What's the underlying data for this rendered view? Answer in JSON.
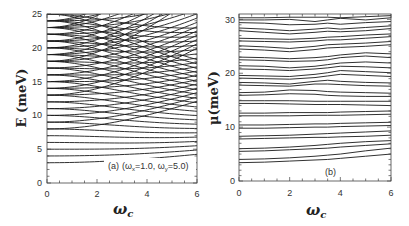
{
  "chart_data": [
    {
      "panel": "a",
      "type": "line",
      "title": "",
      "xlabel": "ω_c",
      "ylabel": "E (meV)",
      "xlim": [
        0,
        6
      ],
      "ylim": [
        0,
        25
      ],
      "xticks": [
        0,
        2,
        4,
        6
      ],
      "yticks": [
        0,
        5,
        10,
        15,
        20,
        25
      ],
      "annotation": "(a) (ω_x=1.0, ω_y=5.0)",
      "grid": false,
      "model": {
        "omega_x": 1.0,
        "omega_y": 5.0,
        "emax": 25.6
      },
      "description": "Energy levels E=(n+1/2)ω+ + (m+1/2)ω− of an anisotropic 2D oscillator vs cyclotron frequency; at ω_c=0 levels at 3,4,5,6,7,8,8,9,9,...",
      "series_start_values": [
        3,
        4,
        5,
        6,
        7,
        8,
        8,
        9,
        9,
        10,
        10,
        11,
        11,
        12,
        12,
        13,
        13,
        13,
        14,
        14,
        14,
        15,
        15,
        15,
        16,
        16,
        16,
        17,
        17,
        17,
        18,
        18,
        18,
        18,
        19,
        19,
        19,
        19,
        20,
        20,
        20,
        20,
        21,
        21,
        21,
        21,
        22,
        22,
        22,
        22
      ]
    },
    {
      "panel": "b",
      "type": "line",
      "title": "",
      "xlabel": "ω_c",
      "ylabel": "μ(meV)",
      "xlim": [
        0,
        6
      ],
      "ylim": [
        0,
        31
      ],
      "xticks": [
        0,
        2,
        4,
        6
      ],
      "yticks": [
        0,
        10,
        20,
        30
      ],
      "annotation": "(b)",
      "grid": false,
      "x": [
        0,
        1,
        2,
        3,
        3.5,
        4,
        5,
        6
      ],
      "series": [
        {
          "name": "μ1",
          "values": [
            3.4,
            3.5,
            3.7,
            3.9,
            4.0,
            4.2,
            4.6,
            5.0
          ]
        },
        {
          "name": "μ2",
          "values": [
            4.0,
            4.1,
            4.3,
            4.6,
            4.8,
            5.0,
            5.6,
            6.1
          ]
        },
        {
          "name": "μ3",
          "values": [
            5.5,
            5.6,
            5.8,
            6.0,
            6.1,
            6.3,
            6.6,
            6.9
          ]
        },
        {
          "name": "μ4",
          "values": [
            6.0,
            6.1,
            6.3,
            6.6,
            6.8,
            7.0,
            7.3,
            7.5
          ]
        },
        {
          "name": "μ5",
          "values": [
            7.8,
            7.9,
            8.0,
            8.1,
            8.1,
            8.2,
            8.3,
            8.5
          ]
        },
        {
          "name": "μ6",
          "values": [
            8.3,
            8.4,
            8.5,
            8.7,
            8.8,
            8.9,
            9.1,
            9.3
          ]
        },
        {
          "name": "μ7",
          "values": [
            9.8,
            9.8,
            9.9,
            10.0,
            10.0,
            10.1,
            10.2,
            10.3
          ]
        },
        {
          "name": "μ8",
          "values": [
            10.4,
            10.4,
            10.5,
            10.6,
            10.6,
            10.7,
            10.8,
            10.9
          ]
        },
        {
          "name": "μ9",
          "values": [
            12.1,
            12.1,
            12.1,
            12.2,
            12.2,
            12.2,
            12.3,
            12.4
          ]
        },
        {
          "name": "μ10",
          "values": [
            12.6,
            12.6,
            12.7,
            12.7,
            12.7,
            12.8,
            12.9,
            13.0
          ]
        },
        {
          "name": "μ11",
          "values": [
            14.4,
            14.4,
            14.3,
            14.2,
            14.2,
            14.2,
            14.1,
            14.0
          ]
        },
        {
          "name": "μ12",
          "values": [
            14.9,
            14.9,
            14.9,
            14.8,
            14.8,
            14.8,
            14.8,
            14.8
          ]
        },
        {
          "name": "μ13",
          "values": [
            15.9,
            16.0,
            16.2,
            16.1,
            15.9,
            15.8,
            15.7,
            15.7
          ]
        },
        {
          "name": "μ14",
          "values": [
            16.4,
            16.5,
            16.9,
            16.8,
            16.6,
            16.5,
            16.4,
            16.3
          ]
        },
        {
          "name": "μ15",
          "values": [
            17.8,
            17.7,
            17.6,
            18.0,
            18.0,
            17.9,
            17.7,
            17.6
          ]
        },
        {
          "name": "μ16",
          "values": [
            18.3,
            18.2,
            18.0,
            18.5,
            18.7,
            18.5,
            18.3,
            18.2
          ]
        },
        {
          "name": "μ17",
          "values": [
            19.1,
            19.0,
            18.9,
            19.2,
            19.5,
            19.8,
            19.6,
            19.4
          ]
        },
        {
          "name": "μ18",
          "values": [
            19.6,
            19.5,
            19.4,
            19.8,
            20.1,
            20.5,
            20.3,
            20.1
          ]
        },
        {
          "name": "μ19",
          "values": [
            20.8,
            20.7,
            20.5,
            20.8,
            21.0,
            21.3,
            21.2,
            21.0
          ]
        },
        {
          "name": "μ20",
          "values": [
            21.4,
            21.3,
            21.0,
            21.3,
            21.6,
            21.9,
            22.1,
            21.9
          ]
        },
        {
          "name": "μ21",
          "values": [
            22.5,
            22.4,
            22.2,
            22.3,
            22.5,
            22.9,
            23.2,
            22.9
          ]
        },
        {
          "name": "μ22",
          "values": [
            23.0,
            22.9,
            22.7,
            22.9,
            23.1,
            23.4,
            23.8,
            23.6
          ]
        },
        {
          "name": "μ23",
          "values": [
            24.5,
            24.3,
            24.0,
            24.4,
            24.7,
            24.8,
            25.0,
            25.3
          ]
        },
        {
          "name": "μ24",
          "values": [
            25.1,
            24.9,
            24.6,
            25.0,
            25.3,
            25.4,
            25.6,
            25.9
          ]
        },
        {
          "name": "μ25",
          "values": [
            26.0,
            25.9,
            25.8,
            26.0,
            26.2,
            26.2,
            26.5,
            26.8
          ]
        },
        {
          "name": "μ26",
          "values": [
            26.5,
            26.4,
            26.3,
            26.5,
            26.7,
            26.8,
            27.1,
            27.3
          ]
        },
        {
          "name": "μ27",
          "values": [
            27.9,
            27.6,
            27.3,
            27.6,
            27.8,
            27.7,
            27.9,
            28.3
          ]
        },
        {
          "name": "μ28",
          "values": [
            28.4,
            28.2,
            27.9,
            28.2,
            28.4,
            28.2,
            28.5,
            28.8
          ]
        },
        {
          "name": "μ29",
          "values": [
            29.4,
            29.3,
            29.0,
            29.1,
            29.3,
            29.1,
            29.4,
            29.6
          ]
        },
        {
          "name": "μ30",
          "values": [
            29.9,
            29.9,
            30.0,
            29.6,
            29.9,
            30.2,
            29.9,
            30.3
          ]
        },
        {
          "name": "μ31",
          "values": [
            30.3,
            30.3,
            30.4,
            30.4,
            30.4,
            30.3,
            30.5,
            30.7
          ]
        }
      ]
    }
  ],
  "panels": {
    "a": {
      "ylabel": "E (meV)",
      "xlabel": "ω",
      "xlabel_sub": "c",
      "annotation_prefix": "(a)",
      "annotation_body": "(ω",
      "annotation_sub1": "x",
      "annotation_mid": "=1.0,  ω",
      "annotation_sub2": "y",
      "annotation_end": "=5.0)",
      "xtick_labels": [
        "0",
        "2",
        "4",
        "6"
      ],
      "ytick_labels": [
        "0",
        "5",
        "10",
        "15",
        "20",
        "25"
      ]
    },
    "b": {
      "ylabel": "μ(meV)",
      "xlabel": "ω",
      "xlabel_sub": "c",
      "annotation": "(b)",
      "xtick_labels": [
        "0",
        "2",
        "4",
        "6"
      ],
      "ytick_labels": [
        "0",
        "10",
        "20",
        "30"
      ]
    }
  }
}
